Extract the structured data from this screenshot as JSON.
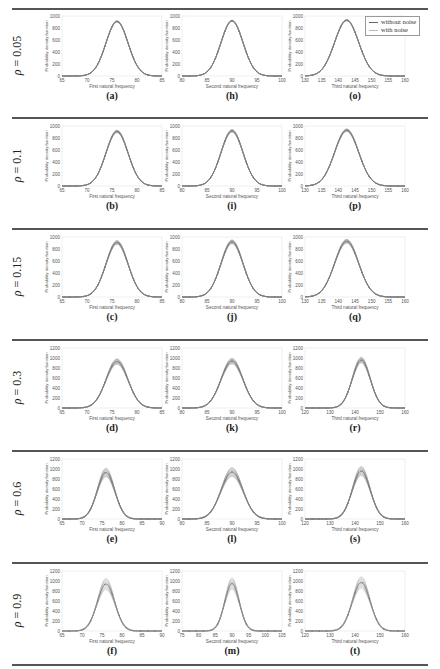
{
  "figure": {
    "rows": [
      {
        "rho_symbol": "ρ",
        "rho_value": "= 0.05"
      },
      {
        "rho_symbol": "ρ",
        "rho_value": "= 0.1"
      },
      {
        "rho_symbol": "ρ",
        "rho_value": "= 0.15"
      },
      {
        "rho_symbol": "ρ",
        "rho_value": "= 0.3"
      },
      {
        "rho_symbol": "ρ",
        "rho_value": "= 0.6"
      },
      {
        "rho_symbol": "ρ",
        "rho_value": "= 0.9"
      }
    ],
    "legend": {
      "without_noise": "without noise",
      "with_noise": "with noise"
    },
    "ylabel": "Probability density function",
    "xlabels": [
      "First natural frequency",
      "Second natural frequency",
      "Third natural frequency"
    ],
    "sublabels": [
      [
        "(a)",
        "(h)",
        "(o)"
      ],
      [
        "(b)",
        "(i)",
        "(p)"
      ],
      [
        "(c)",
        "(j)",
        "(q)"
      ],
      [
        "(d)",
        "(k)",
        "(r)"
      ],
      [
        "(e)",
        "(l)",
        "(s)"
      ],
      [
        "(f)",
        "(m)",
        "(t)"
      ]
    ]
  },
  "chart_data": {
    "type": "line",
    "legend": [
      "without noise",
      "with noise"
    ],
    "legend_position": "upper right of panel (o)",
    "grid": false,
    "panels": [
      {
        "label": "(a)",
        "rho": 0.05,
        "xlabel": "First natural frequency",
        "ylabel": "Probability density function",
        "xlim": [
          65,
          85
        ],
        "xticks": [
          65,
          70,
          75,
          80,
          85
        ],
        "ylim": [
          0,
          1000
        ],
        "yticks": [
          0,
          200,
          400,
          600,
          800,
          1000
        ],
        "mean": 76,
        "peak": 910,
        "spread": 0.02
      },
      {
        "label": "(h)",
        "rho": 0.05,
        "xlabel": "Second natural frequency",
        "ylabel": "Probability density function",
        "xlim": [
          80,
          100
        ],
        "xticks": [
          80,
          85,
          90,
          95,
          100
        ],
        "ylim": [
          0,
          1000
        ],
        "yticks": [
          0,
          200,
          400,
          600,
          800,
          1000
        ],
        "mean": 90,
        "peak": 920,
        "spread": 0.02
      },
      {
        "label": "(o)",
        "rho": 0.05,
        "xlabel": "Third natural frequency",
        "ylabel": "Probability density function",
        "xlim": [
          130,
          160
        ],
        "xticks": [
          130,
          135,
          140,
          145,
          150,
          155,
          160
        ],
        "ylim": [
          0,
          1000
        ],
        "yticks": [
          0,
          200,
          400,
          600,
          800,
          1000
        ],
        "mean": 142.5,
        "peak": 930,
        "spread": 0.02
      },
      {
        "label": "(b)",
        "rho": 0.1,
        "xlabel": "First natural frequency",
        "ylabel": "Probability density function",
        "xlim": [
          65,
          85
        ],
        "xticks": [
          65,
          70,
          75,
          80,
          85
        ],
        "ylim": [
          0,
          1000
        ],
        "yticks": [
          0,
          200,
          400,
          600,
          800,
          1000
        ],
        "mean": 76,
        "peak": 910,
        "spread": 0.04
      },
      {
        "label": "(i)",
        "rho": 0.1,
        "xlabel": "Second natural frequency",
        "ylabel": "Probability density function",
        "xlim": [
          80,
          100
        ],
        "xticks": [
          80,
          85,
          90,
          95,
          100
        ],
        "ylim": [
          0,
          1000
        ],
        "yticks": [
          0,
          200,
          400,
          600,
          800,
          1000
        ],
        "mean": 90,
        "peak": 920,
        "spread": 0.04
      },
      {
        "label": "(p)",
        "rho": 0.1,
        "xlabel": "Third natural frequency",
        "ylabel": "Probability density function",
        "xlim": [
          130,
          160
        ],
        "xticks": [
          130,
          135,
          140,
          145,
          150,
          155,
          160
        ],
        "ylim": [
          0,
          1000
        ],
        "yticks": [
          0,
          200,
          400,
          600,
          800,
          1000
        ],
        "mean": 142.5,
        "peak": 930,
        "spread": 0.04
      },
      {
        "label": "(c)",
        "rho": 0.15,
        "xlabel": "First natural frequency",
        "ylabel": "Probability density function",
        "xlim": [
          65,
          85
        ],
        "xticks": [
          65,
          70,
          75,
          80,
          85
        ],
        "ylim": [
          0,
          1000
        ],
        "yticks": [
          0,
          200,
          400,
          600,
          800,
          1000
        ],
        "mean": 76,
        "peak": 910,
        "spread": 0.06
      },
      {
        "label": "(j)",
        "rho": 0.15,
        "xlabel": "Second natural frequency",
        "ylabel": "Probability density function",
        "xlim": [
          80,
          100
        ],
        "xticks": [
          80,
          85,
          90,
          95,
          100
        ],
        "ylim": [
          0,
          1000
        ],
        "yticks": [
          0,
          200,
          400,
          600,
          800,
          1000
        ],
        "mean": 90,
        "peak": 920,
        "spread": 0.06
      },
      {
        "label": "(q)",
        "rho": 0.15,
        "xlabel": "Third natural frequency",
        "ylabel": "Probability density function",
        "xlim": [
          130,
          160
        ],
        "xticks": [
          130,
          135,
          140,
          145,
          150,
          155,
          160
        ],
        "ylim": [
          0,
          1000
        ],
        "yticks": [
          0,
          200,
          400,
          600,
          800,
          1000
        ],
        "mean": 142.5,
        "peak": 930,
        "spread": 0.06
      },
      {
        "label": "(d)",
        "rho": 0.3,
        "xlabel": "First natural frequency",
        "ylabel": "Probability density function",
        "xlim": [
          65,
          85
        ],
        "xticks": [
          65,
          70,
          75,
          80,
          85
        ],
        "ylim": [
          0,
          1200
        ],
        "yticks": [
          0,
          200,
          400,
          600,
          800,
          1000,
          1200
        ],
        "mean": 76,
        "peak": 930,
        "spread": 0.1
      },
      {
        "label": "(k)",
        "rho": 0.3,
        "xlabel": "Second natural frequency",
        "ylabel": "Probability density function",
        "xlim": [
          80,
          100
        ],
        "xticks": [
          80,
          85,
          90,
          95,
          100
        ],
        "ylim": [
          0,
          1200
        ],
        "yticks": [
          0,
          200,
          400,
          600,
          800,
          1000,
          1200
        ],
        "mean": 90,
        "peak": 940,
        "spread": 0.1
      },
      {
        "label": "(r)",
        "rho": 0.3,
        "xlabel": "Third natural frequency",
        "ylabel": "Probability density function",
        "xlim": [
          120,
          160
        ],
        "xticks": [
          120,
          130,
          140,
          150,
          160
        ],
        "ylim": [
          0,
          1200
        ],
        "yticks": [
          0,
          200,
          400,
          600,
          800,
          1000,
          1200
        ],
        "mean": 142.5,
        "peak": 960,
        "spread": 0.1
      },
      {
        "label": "(e)",
        "rho": 0.6,
        "xlabel": "First natural frequency",
        "ylabel": "Probability density function",
        "xlim": [
          65,
          90
        ],
        "xticks": [
          65,
          70,
          75,
          80,
          85,
          90
        ],
        "ylim": [
          0,
          1200
        ],
        "yticks": [
          0,
          200,
          400,
          600,
          800,
          1000,
          1200
        ],
        "mean": 76,
        "peak": 930,
        "spread": 0.16
      },
      {
        "label": "(l)",
        "rho": 0.6,
        "xlabel": "Second natural frequency",
        "ylabel": "Probability density function",
        "xlim": [
          80,
          100
        ],
        "xticks": [
          80,
          85,
          90,
          95,
          100
        ],
        "ylim": [
          0,
          1200
        ],
        "yticks": [
          0,
          200,
          400,
          600,
          800,
          1000,
          1200
        ],
        "mean": 90,
        "peak": 940,
        "spread": 0.16
      },
      {
        "label": "(s)",
        "rho": 0.6,
        "xlabel": "Third natural frequency",
        "ylabel": "Probability density function",
        "xlim": [
          120,
          160
        ],
        "xticks": [
          120,
          130,
          140,
          150,
          160
        ],
        "ylim": [
          0,
          1200
        ],
        "yticks": [
          0,
          200,
          400,
          600,
          800,
          1000,
          1200
        ],
        "mean": 142.5,
        "peak": 960,
        "spread": 0.16
      },
      {
        "label": "(f)",
        "rho": 0.9,
        "xlabel": "First natural frequency",
        "ylabel": "Probability density function",
        "xlim": [
          65,
          90
        ],
        "xticks": [
          65,
          70,
          75,
          80,
          85,
          90
        ],
        "ylim": [
          0,
          1200
        ],
        "yticks": [
          0,
          200,
          400,
          600,
          800,
          1000,
          1200
        ],
        "mean": 76,
        "peak": 940,
        "spread": 0.2
      },
      {
        "label": "(m)",
        "rho": 0.9,
        "xlabel": "Second natural frequency",
        "ylabel": "Probability density function",
        "xlim": [
          75,
          105
        ],
        "xticks": [
          75,
          80,
          85,
          90,
          95,
          100,
          105
        ],
        "ylim": [
          0,
          1200
        ],
        "yticks": [
          0,
          200,
          400,
          600,
          800,
          1000,
          1200
        ],
        "mean": 90,
        "peak": 950,
        "spread": 0.2
      },
      {
        "label": "(t)",
        "rho": 0.9,
        "xlabel": "Third natural frequency",
        "ylabel": "Probability density function",
        "xlim": [
          120,
          160
        ],
        "xticks": [
          120,
          130,
          140,
          150,
          160
        ],
        "ylim": [
          0,
          1200
        ],
        "yticks": [
          0,
          200,
          400,
          600,
          800,
          1000,
          1200
        ],
        "mean": 142.5,
        "peak": 970,
        "spread": 0.2
      }
    ]
  }
}
